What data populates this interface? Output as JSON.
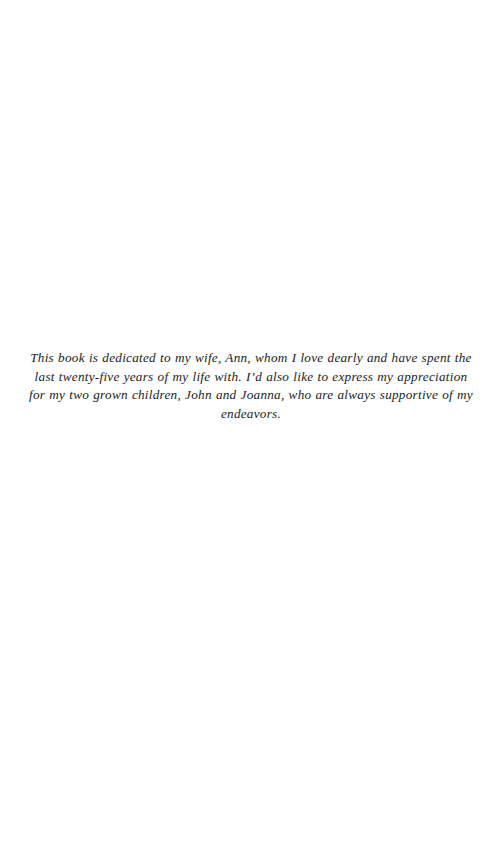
{
  "page": {
    "kind": "book-dedication-page",
    "background_color": "#ffffff",
    "text_color": "#201d1c",
    "page_width": 502,
    "page_height": 868
  },
  "dedication": {
    "text": "This book is dedicated to my wife, Ann, whom I love dearly and have spent the last twenty-five years of my life with. I’d also like to express my appreciation for my two grown children, John and Joanna, who are always supportive of my endeavors.",
    "lines": [
      "This book is dedicated to my wife, Ann, whom I love dearly and have spent the last",
      "twenty-five years of my life with. I’d also like to express my appreciation for my two",
      "grown children, John and Joanna, who are always supportive of my endeavors."
    ],
    "alignment": "center",
    "style": "italic"
  }
}
